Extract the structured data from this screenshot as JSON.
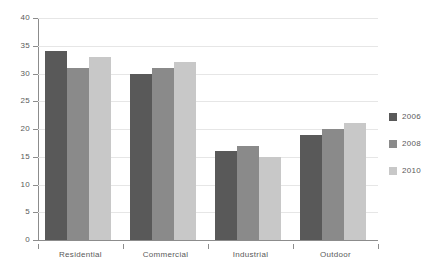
{
  "chart_data": {
    "type": "bar",
    "title": "",
    "subtitle": "",
    "xlabel": "",
    "ylabel": "",
    "categories": [
      "Residential",
      "Commercial",
      "Industrial",
      "Outdoor"
    ],
    "series": [
      {
        "name": "2006",
        "color": "#595959",
        "values": [
          34,
          30,
          16,
          19
        ]
      },
      {
        "name": "2008",
        "color": "#8a8a8a",
        "values": [
          31,
          31,
          17,
          20
        ]
      },
      {
        "name": "2010",
        "color": "#c8c8c8",
        "values": [
          33,
          32,
          15,
          21
        ]
      }
    ],
    "ylim": [
      0,
      40
    ],
    "yticks": [
      0,
      5,
      10,
      15,
      20,
      25,
      30,
      35,
      40
    ],
    "ytick_labels": [
      "0",
      "5",
      "10",
      "15",
      "20",
      "25",
      "30",
      "35",
      "40"
    ],
    "grid": true,
    "grid_axis": "y",
    "legend_position": "right",
    "legend_entries": [
      "2006",
      "2008",
      "2010"
    ],
    "annotations": [],
    "background_color": "#ffffff",
    "grid_color": "#e6e6e6",
    "axis_color": "#8c8c8c",
    "text_color": "#5a5a5a"
  }
}
